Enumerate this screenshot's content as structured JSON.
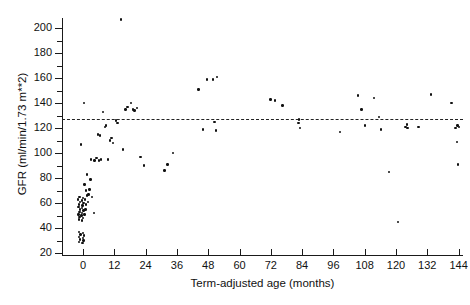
{
  "chart_data": {
    "type": "scatter",
    "title": "",
    "xlabel": "Term-adjusted age (months)",
    "ylabel": "GFR (ml/min/1.73 m**2)",
    "xlim": [
      -6,
      150
    ],
    "ylim": [
      18,
      210
    ],
    "xticks": [
      0,
      12,
      24,
      36,
      48,
      60,
      72,
      84,
      96,
      108,
      120,
      132,
      144
    ],
    "xtick_labels": [
      "0",
      "12",
      "24",
      "36",
      "48",
      "60",
      "72",
      "84",
      "96",
      "108",
      "120",
      "132",
      "144"
    ],
    "yticks": [
      20,
      40,
      60,
      80,
      100,
      120,
      140,
      160,
      180,
      200
    ],
    "ytick_labels": [
      "20",
      "40",
      "60",
      "80",
      "100",
      "120",
      "140",
      "160",
      "180",
      "200"
    ],
    "y_minor_ticks": [
      30,
      50,
      70,
      90,
      110,
      130,
      150,
      170,
      190,
      210
    ],
    "grid": false,
    "legend": null,
    "reference_line": {
      "orientation": "horizontal",
      "value": 127,
      "style": "dashed",
      "label": ""
    },
    "series": [
      {
        "name": "GFR measurements",
        "marker": "dot",
        "color": "#111111",
        "points": [
          [
            -1.5,
            29
          ],
          [
            -1.2,
            31
          ],
          [
            -1.5,
            33
          ],
          [
            -1.0,
            35
          ],
          [
            -1.6,
            37
          ],
          [
            -0.2,
            28
          ],
          [
            0.1,
            30
          ],
          [
            -0.1,
            32
          ],
          [
            0.3,
            34
          ],
          [
            0.0,
            36
          ],
          [
            -1.6,
            47
          ],
          [
            -1.3,
            49
          ],
          [
            -1.8,
            51
          ],
          [
            -1.4,
            53
          ],
          [
            -1.1,
            55
          ],
          [
            -1.7,
            57
          ],
          [
            -1.5,
            59
          ],
          [
            -1.2,
            61
          ],
          [
            -1.9,
            63
          ],
          [
            -1.4,
            65
          ],
          [
            -0.4,
            46
          ],
          [
            -0.1,
            48
          ],
          [
            -0.6,
            50
          ],
          [
            -0.3,
            52
          ],
          [
            0.1,
            54
          ],
          [
            -0.5,
            56
          ],
          [
            -0.2,
            58
          ],
          [
            0.2,
            60
          ],
          [
            -0.4,
            62
          ],
          [
            0.0,
            64
          ],
          [
            0.6,
            51
          ],
          [
            0.9,
            55
          ],
          [
            1.2,
            59
          ],
          [
            0.7,
            63
          ],
          [
            1.4,
            66
          ],
          [
            1.8,
            61
          ],
          [
            2.1,
            67
          ],
          [
            1.1,
            70
          ],
          [
            2.4,
            71
          ],
          [
            0.5,
            75
          ],
          [
            1.6,
            83
          ],
          [
            2.8,
            79
          ],
          [
            3.4,
            65
          ],
          [
            4.2,
            52
          ],
          [
            -0.9,
            107
          ],
          [
            0.4,
            140
          ],
          [
            3.1,
            95
          ],
          [
            4.4,
            94
          ],
          [
            5.2,
            96
          ],
          [
            6.1,
            94
          ],
          [
            6.9,
            95
          ],
          [
            5.8,
            115
          ],
          [
            6.4,
            114
          ],
          [
            7.6,
            133
          ],
          [
            8.4,
            121
          ],
          [
            8.9,
            122
          ],
          [
            9.6,
            95
          ],
          [
            10.4,
            110
          ],
          [
            10.9,
            112
          ],
          [
            11.4,
            108
          ],
          [
            12.6,
            126
          ],
          [
            13.2,
            124
          ],
          [
            14.5,
            207
          ],
          [
            15.4,
            103
          ],
          [
            16.2,
            135
          ],
          [
            17.1,
            137
          ],
          [
            18.4,
            140
          ],
          [
            19.2,
            135
          ],
          [
            19.8,
            134
          ],
          [
            20.6,
            136
          ],
          [
            22.1,
            97
          ],
          [
            23.4,
            90
          ],
          [
            31.2,
            86
          ],
          [
            32.4,
            91
          ],
          [
            34.6,
            100
          ],
          [
            44.2,
            151
          ],
          [
            47.6,
            159
          ],
          [
            49.8,
            159
          ],
          [
            51.4,
            161
          ],
          [
            50.4,
            125
          ],
          [
            50.9,
            118
          ],
          [
            46.1,
            119
          ],
          [
            71.8,
            143
          ],
          [
            73.6,
            142
          ],
          [
            76.4,
            138
          ],
          [
            82.6,
            124
          ],
          [
            82.9,
            127
          ],
          [
            83.1,
            120
          ],
          [
            98.6,
            117
          ],
          [
            105.4,
            146
          ],
          [
            106.8,
            135
          ],
          [
            108.2,
            122
          ],
          [
            111.6,
            144
          ],
          [
            113.4,
            129
          ],
          [
            114.2,
            119
          ],
          [
            117.2,
            85
          ],
          [
            120.8,
            45
          ],
          [
            123.6,
            121
          ],
          [
            124.1,
            123
          ],
          [
            124.4,
            120
          ],
          [
            128.6,
            121
          ],
          [
            133.4,
            147
          ],
          [
            141.2,
            140
          ],
          [
            142.8,
            120
          ],
          [
            143.6,
            122
          ],
          [
            144.2,
            121
          ],
          [
            143.4,
            109
          ],
          [
            143.8,
            91
          ]
        ]
      }
    ]
  }
}
